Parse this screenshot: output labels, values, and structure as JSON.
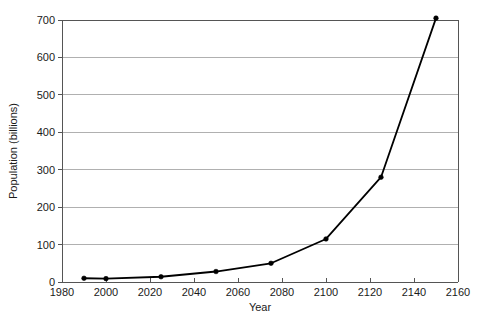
{
  "chart_data": {
    "type": "line",
    "title": "",
    "xlabel": "Year",
    "ylabel": "Population (billions)",
    "xlim": [
      1980,
      2160
    ],
    "ylim": [
      0,
      700
    ],
    "xticks": [
      1980,
      2000,
      2020,
      2040,
      2060,
      2080,
      2100,
      2120,
      2140,
      2160
    ],
    "yticks": [
      0,
      100,
      200,
      300,
      400,
      500,
      600,
      700
    ],
    "grid": "horizontal",
    "legend": "none",
    "marker": "filled-circle",
    "line_color": "#000000",
    "grid_color": "#b0b0b0",
    "axis_color": "#555555",
    "series": [
      {
        "name": "Population",
        "x": [
          1990,
          2000,
          2025,
          2050,
          2075,
          2100,
          2125,
          2150
        ],
        "values": [
          10,
          9,
          14,
          28,
          50,
          115,
          280,
          705
        ]
      }
    ]
  },
  "axis": {
    "x_title": "Year",
    "y_title": "Population (billions)",
    "x_tick_labels": [
      "1980",
      "2000",
      "2020",
      "2040",
      "2060",
      "2080",
      "2100",
      "2120",
      "2140",
      "2160"
    ],
    "y_tick_labels": [
      "0",
      "100",
      "200",
      "300",
      "400",
      "500",
      "600",
      "700"
    ]
  }
}
